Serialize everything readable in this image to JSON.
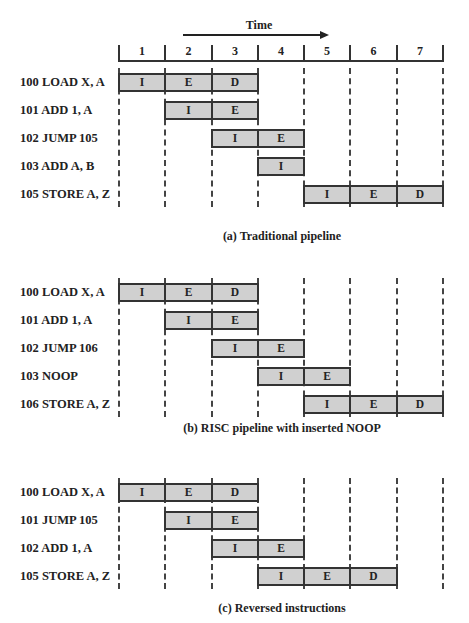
{
  "header": {
    "time_label": "Time",
    "cycles": [
      "1",
      "2",
      "3",
      "4",
      "5",
      "6",
      "7"
    ]
  },
  "grid": {
    "x": [
      119,
      165,
      212,
      258,
      304,
      350,
      397,
      443
    ]
  },
  "colors": {
    "stage_fill": "#d0d0d0",
    "stage_border": "#333333",
    "line": "#333333"
  },
  "diagrams": [
    {
      "caption": "(a) Traditional pipeline",
      "top": 73,
      "caption_y": 229,
      "rows": [
        {
          "label": "100 LOAD X, A",
          "start": 1,
          "stages": [
            "I",
            "E",
            "D"
          ]
        },
        {
          "label": "101 ADD 1, A",
          "start": 2,
          "stages": [
            "I",
            "E"
          ]
        },
        {
          "label": "102 JUMP 105",
          "start": 3,
          "stages": [
            "I",
            "E"
          ]
        },
        {
          "label": "103 ADD A, B",
          "start": 4,
          "stages": [
            "I"
          ]
        },
        {
          "label": "105 STORE A, Z",
          "start": 5,
          "stages": [
            "I",
            "E",
            "D"
          ]
        }
      ]
    },
    {
      "caption": "(b) RISC pipeline with inserted NOOP",
      "top": 283,
      "caption_y": 421,
      "rows": [
        {
          "label": "100 LOAD X, A",
          "start": 1,
          "stages": [
            "I",
            "E",
            "D"
          ]
        },
        {
          "label": "101 ADD 1, A",
          "start": 2,
          "stages": [
            "I",
            "E"
          ]
        },
        {
          "label": "102 JUMP 106",
          "start": 3,
          "stages": [
            "I",
            "E"
          ]
        },
        {
          "label": "103 NOOP",
          "start": 4,
          "stages": [
            "I",
            "E"
          ]
        },
        {
          "label": "106 STORE A, Z",
          "start": 5,
          "stages": [
            "I",
            "E",
            "D"
          ]
        }
      ]
    },
    {
      "caption": "(c) Reversed instructions",
      "top": 483,
      "caption_y": 601,
      "rows": [
        {
          "label": "100 LOAD X, A",
          "start": 1,
          "stages": [
            "I",
            "E",
            "D"
          ]
        },
        {
          "label": "101 JUMP 105",
          "start": 2,
          "stages": [
            "I",
            "E"
          ]
        },
        {
          "label": "102 ADD 1, A",
          "start": 3,
          "stages": [
            "I",
            "E"
          ]
        },
        {
          "label": "105 STORE A, Z",
          "start": 4,
          "stages": [
            "I",
            "E",
            "D"
          ]
        }
      ]
    }
  ]
}
